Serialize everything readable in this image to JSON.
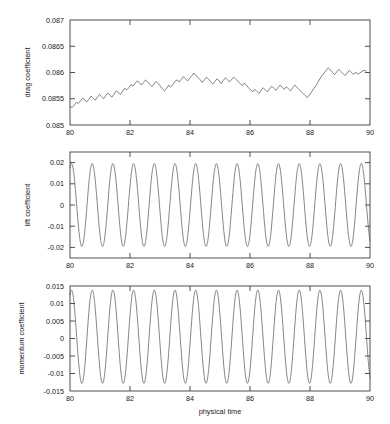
{
  "figure": {
    "background_color": "#ffffff",
    "line_color": "#555a5e",
    "axis_color": "#3c3c3c",
    "xlabel": "physical time"
  },
  "chart_data": [
    {
      "type": "line",
      "panel_index": 0,
      "title": "",
      "xlabel": "",
      "ylabel": "drag coefficient",
      "xlim": [
        80,
        90
      ],
      "ylim": [
        0.085,
        0.087
      ],
      "xticks": [
        80,
        82,
        84,
        86,
        88,
        90
      ],
      "xtick_labels": [
        "80",
        "82",
        "84",
        "86",
        "88",
        "90"
      ],
      "yticks": [
        0.085,
        0.0855,
        0.086,
        0.0865,
        0.087
      ],
      "ytick_labels": [
        "0.085",
        "0.0855",
        "0.086",
        "0.0865",
        "0.087"
      ],
      "grid": false,
      "legend": null,
      "series": [
        {
          "name": "drag coefficient",
          "description": "Noisy quasi-periodic signal with slow upward drift; mean rises from about 0.08545 near t=80 to about 0.08595 near t=90, with high-frequency ripple of roughly 0.00005 to 0.0001 amplitude.",
          "x": [
            80.0,
            80.07,
            80.14,
            80.21,
            80.28,
            80.35,
            80.42,
            80.49,
            80.56,
            80.63,
            80.7,
            80.77,
            80.84,
            80.91,
            80.98,
            81.05,
            81.12,
            81.19,
            81.26,
            81.33,
            81.4,
            81.47,
            81.54,
            81.61,
            81.68,
            81.75,
            81.82,
            81.89,
            81.96,
            82.03,
            82.1,
            82.17,
            82.24,
            82.31,
            82.38,
            82.45,
            82.52,
            82.59,
            82.66,
            82.73,
            82.8,
            82.87,
            82.94,
            83.01,
            83.08,
            83.15,
            83.22,
            83.29,
            83.36,
            83.43,
            83.5,
            83.57,
            83.64,
            83.71,
            83.78,
            83.85,
            83.92,
            83.99,
            84.06,
            84.13,
            84.2,
            84.27,
            84.34,
            84.41,
            84.48,
            84.55,
            84.62,
            84.69,
            84.76,
            84.83,
            84.9,
            84.97,
            85.04,
            85.11,
            85.18,
            85.25,
            85.32,
            85.39,
            85.46,
            85.53,
            85.6,
            85.67,
            85.74,
            85.81,
            85.88,
            85.95,
            86.02,
            86.09,
            86.16,
            86.23,
            86.3,
            86.37,
            86.44,
            86.51,
            86.58,
            86.65,
            86.72,
            86.79,
            86.86,
            86.93,
            87.0,
            87.07,
            87.14,
            87.21,
            87.28,
            87.35,
            87.42,
            87.49,
            87.56,
            87.63,
            87.7,
            87.77,
            87.84,
            87.91,
            87.98,
            88.05,
            88.12,
            88.19,
            88.26,
            88.33,
            88.4,
            88.47,
            88.54,
            88.61,
            88.68,
            88.75,
            88.82,
            88.89,
            88.96,
            89.03,
            89.1,
            89.17,
            89.24,
            89.31,
            89.38,
            89.45,
            89.52,
            89.59,
            89.66,
            89.73,
            89.8,
            89.87,
            89.94,
            90.0
          ],
          "y": [
            0.08536,
            0.08533,
            0.08538,
            0.08543,
            0.08541,
            0.08546,
            0.08551,
            0.08548,
            0.08544,
            0.08549,
            0.08555,
            0.08551,
            0.08547,
            0.08553,
            0.08558,
            0.08554,
            0.0855,
            0.08556,
            0.08561,
            0.08557,
            0.08553,
            0.08559,
            0.08565,
            0.08562,
            0.08558,
            0.08564,
            0.0857,
            0.08567,
            0.08571,
            0.08577,
            0.08574,
            0.08579,
            0.08584,
            0.08581,
            0.08576,
            0.08581,
            0.08586,
            0.08582,
            0.08577,
            0.08573,
            0.08578,
            0.08583,
            0.08579,
            0.08574,
            0.08569,
            0.08565,
            0.0857,
            0.08576,
            0.08572,
            0.08577,
            0.08583,
            0.08586,
            0.08582,
            0.08587,
            0.08592,
            0.08588,
            0.08584,
            0.08589,
            0.08594,
            0.08599,
            0.08595,
            0.0859,
            0.08586,
            0.08581,
            0.08586,
            0.08591,
            0.08587,
            0.08582,
            0.08578,
            0.08583,
            0.08588,
            0.08584,
            0.08579,
            0.08585,
            0.0859,
            0.08586,
            0.08582,
            0.08587,
            0.08591,
            0.08587,
            0.08583,
            0.08579,
            0.08575,
            0.0858,
            0.08576,
            0.08571,
            0.08567,
            0.08563,
            0.08568,
            0.08564,
            0.0856,
            0.08566,
            0.08571,
            0.08567,
            0.08563,
            0.08569,
            0.08574,
            0.0857,
            0.08566,
            0.08571,
            0.08576,
            0.08572,
            0.08568,
            0.08573,
            0.08569,
            0.08565,
            0.08571,
            0.08576,
            0.08572,
            0.08568,
            0.08564,
            0.0856,
            0.08556,
            0.08552,
            0.08557,
            0.08563,
            0.08569,
            0.08574,
            0.08581,
            0.08588,
            0.08594,
            0.08599,
            0.08604,
            0.08609,
            0.08605,
            0.086,
            0.08596,
            0.08601,
            0.08606,
            0.08602,
            0.08598,
            0.08594,
            0.08599,
            0.08604,
            0.086,
            0.08596,
            0.08601,
            0.08597,
            0.08599,
            0.08602,
            0.08604,
            0.08603
          ]
        }
      ]
    },
    {
      "type": "line",
      "panel_index": 1,
      "title": "",
      "xlabel": "",
      "ylabel": "lift coefficient",
      "xlim": [
        80,
        90
      ],
      "ylim": [
        -0.025,
        0.025
      ],
      "xticks": [
        80,
        82,
        84,
        86,
        88,
        90
      ],
      "xtick_labels": [
        "80",
        "82",
        "84",
        "86",
        "88",
        "90"
      ],
      "yticks": [
        -0.02,
        -0.01,
        0,
        0.01,
        0.02
      ],
      "ytick_labels": [
        "-0.02",
        "-0.01",
        "0",
        "0.01",
        "0.02"
      ],
      "grid": false,
      "legend": null,
      "series": [
        {
          "name": "lift coefficient",
          "description": "Regular sinusoidal vortex-shedding oscillation, amplitude about 0.0195, period about 0.69 time units (roughly 14.5 cycles from t=80 to t=90), first peak near t=80.05.",
          "amplitude": 0.0195,
          "period": 0.69,
          "phase_peak_t": 80.05,
          "mean": 0.0
        }
      ]
    },
    {
      "type": "line",
      "panel_index": 2,
      "title": "",
      "xlabel": "physical time",
      "ylabel": "momentum coefficient",
      "xlim": [
        80,
        90
      ],
      "ylim": [
        -0.015,
        0.015
      ],
      "xticks": [
        80,
        82,
        84,
        86,
        88,
        90
      ],
      "xtick_labels": [
        "80",
        "82",
        "84",
        "86",
        "88",
        "90"
      ],
      "yticks": [
        -0.015,
        -0.01,
        -0.005,
        0,
        0.005,
        0.01,
        0.015
      ],
      "ytick_labels": [
        "-0.015",
        "-0.01",
        "-0.005",
        "0",
        "0.005",
        "0.01",
        "0.015"
      ],
      "grid": false,
      "legend": null,
      "series": [
        {
          "name": "momentum coefficient",
          "description": "Regular sinusoidal oscillation in phase with the lift signal, peaks near 0.0138 and troughs near -0.0128, period about 0.69 time units, first peak near t=80.05.",
          "amplitude": 0.0133,
          "offset": 0.0005,
          "period": 0.69,
          "phase_peak_t": 80.05
        }
      ]
    }
  ]
}
